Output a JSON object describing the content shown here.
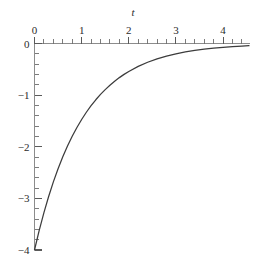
{
  "chart_data": {
    "type": "line",
    "title": "",
    "subtitle": "",
    "xlabel": "t",
    "ylabel": "",
    "xlim": [
      0,
      4.55
    ],
    "ylim": [
      -4,
      0
    ],
    "grid": false,
    "legend": null,
    "axis_position": {
      "x_axis": "top",
      "y_axis": "left"
    },
    "x_major_ticks": [
      0,
      1,
      2,
      3,
      4
    ],
    "x_minor_tick_step": 0.2,
    "y_major_ticks": [
      0,
      -1,
      -2,
      -3,
      -4
    ],
    "y_minor_tick_step": 0.2,
    "x_tick_labels": [
      "0",
      "1",
      "2",
      "3",
      "4"
    ],
    "y_tick_labels": [
      "0",
      "−1",
      "−2",
      "−3",
      "−4"
    ],
    "series": [
      {
        "name": "y = -4e^(-t)",
        "color": "#3c3c3c",
        "x": [
          0,
          0.1,
          0.2,
          0.3,
          0.4,
          0.5,
          0.6,
          0.7,
          0.8,
          0.9,
          1.0,
          1.1,
          1.2,
          1.3,
          1.4,
          1.5,
          1.6,
          1.7,
          1.8,
          1.9,
          2.0,
          2.2,
          2.4,
          2.6,
          2.8,
          3.0,
          3.2,
          3.4,
          3.6,
          3.8,
          4.0,
          4.2,
          4.4,
          4.55
        ],
        "values": [
          -4.0,
          -3.619,
          -3.275,
          -2.963,
          -2.681,
          -2.426,
          -2.195,
          -1.986,
          -1.797,
          -1.627,
          -1.472,
          -1.332,
          -1.205,
          -1.09,
          -0.986,
          -0.893,
          -0.808,
          -0.731,
          -0.661,
          -0.598,
          -0.541,
          -0.443,
          -0.363,
          -0.297,
          -0.243,
          -0.199,
          -0.163,
          -0.134,
          -0.109,
          -0.09,
          -0.073,
          -0.06,
          -0.049,
          -0.042
        ]
      }
    ]
  },
  "axis": {
    "x_name": "t"
  }
}
